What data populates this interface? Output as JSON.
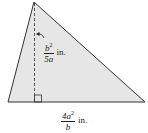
{
  "diagram": {
    "shape": "triangle",
    "fill_color": "#e6e6e6",
    "stroke_color": "#333333",
    "vertices": {
      "apex": [
        34,
        2
      ],
      "bottom_left": [
        8,
        102
      ],
      "bottom_right": [
        145,
        102
      ]
    },
    "height_label": {
      "numerator": "b",
      "numerator_exp": "2",
      "denominator": "5a",
      "unit": "in."
    },
    "base_label": {
      "numerator": "4a",
      "numerator_exp": "2",
      "denominator": "b",
      "unit": "in."
    }
  }
}
